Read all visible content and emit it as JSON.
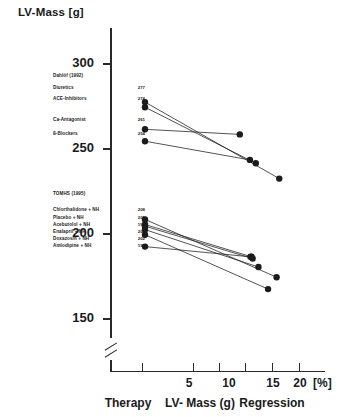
{
  "chart_data": {
    "type": "line",
    "title": "LV-Mass [g]",
    "ylabel": "LV-Mass [g]",
    "xlabel": "Regression",
    "xunit": "[%]",
    "axis_break": true,
    "ylim": [
      140,
      315
    ],
    "yticks": [
      300,
      250,
      200,
      150
    ],
    "xlim": [
      0,
      21
    ],
    "xticks": [
      5,
      10,
      15,
      20
    ],
    "xtick_labels": [
      "5",
      "10",
      "15",
      "20"
    ],
    "grid": false,
    "legend": "none",
    "footer_labels": [
      "Therapy",
      "LV- Mass (g)",
      "Regression"
    ],
    "groups": [
      {
        "study": "Dahlöf (1992)",
        "series": [
          {
            "name": "Diuretics",
            "baseline_mass": 277,
            "regression_pct": 16.3,
            "end_mass": 232
          },
          {
            "name": "ACE-Inhibitors",
            "baseline_mass": 274,
            "regression_pct": 11.9,
            "end_mass": 241
          },
          {
            "name": "Ca-Antagonist",
            "baseline_mass": 261,
            "regression_pct": 8.9,
            "end_mass": 258
          },
          {
            "name": "ß-Blockers",
            "baseline_mass": 254,
            "regression_pct": 10.8,
            "end_mass": 243
          }
        ]
      },
      {
        "study": "TOMHS (1995)",
        "series": [
          {
            "name": "Chlorthalidone + NH",
            "baseline_mass": 208,
            "regression_pct": 15.8,
            "end_mass": 174
          },
          {
            "name": "Placebo + NH",
            "baseline_mass": 205,
            "regression_pct": 11.1,
            "end_mass": 186
          },
          {
            "name": "Acebutolol + NH",
            "baseline_mass": 192,
            "regression_pct": 10.9,
            "end_mass": 186
          },
          {
            "name": "Enalapril + NH",
            "baseline_mass": 204,
            "regression_pct": 11.3,
            "end_mass": 185
          },
          {
            "name": "Doxazosin + NH",
            "baseline_mass": 202,
            "regression_pct": 12.4,
            "end_mass": 180
          },
          {
            "name": "Amlodipine + NH",
            "baseline_mass": 199,
            "regression_pct": 14.2,
            "end_mass": 167
          }
        ]
      }
    ]
  },
  "axis": {
    "y_title": "LV-Mass [g]",
    "y_labels": [
      "300",
      "250",
      "200",
      "150"
    ],
    "x_labels": [
      "5",
      "10",
      "15",
      "20"
    ],
    "x_unit": "[%]"
  },
  "footer": {
    "therapy": "Therapy",
    "lv_mass": "LV- Mass (g)",
    "regression": "Regression"
  },
  "studies": {
    "dahlof": {
      "title": "Dahlöf (1992)",
      "rows": [
        {
          "label": "Diuretics",
          "value": "277"
        },
        {
          "label": "ACE-Inhibitors",
          "value": "274"
        },
        {
          "label": "Ca-Antagonist",
          "value": "261"
        },
        {
          "label": "ß-Blockers",
          "value": "254"
        }
      ]
    },
    "tomhs": {
      "title": "TOMHS (1995)",
      "rows": [
        {
          "label": "Chlorthalidone + NH",
          "value": "208"
        },
        {
          "label": "Placebo + NH",
          "value": "205"
        },
        {
          "label": "Acebutolol + NH",
          "value": "192"
        },
        {
          "label": "Enalapril + NH",
          "value": "204"
        },
        {
          "label": "Doxazosin + NH",
          "value": "202"
        },
        {
          "label": "Amlodipine + NH",
          "value": "199"
        }
      ]
    }
  },
  "colors": {
    "ink": "#1b1b1b",
    "background": "#ffffff"
  }
}
